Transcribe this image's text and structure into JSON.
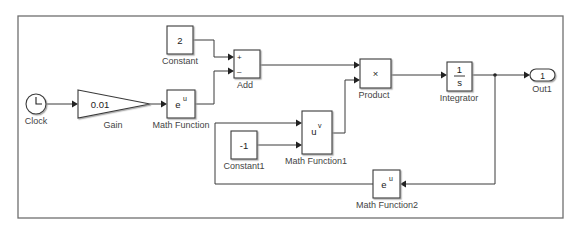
{
  "diagram": {
    "type": "simulink-block-diagram",
    "colors": {
      "background": "#ffffff",
      "frame": "#6f6f6f",
      "block_stroke": "#3a3a3a",
      "label": "#444444"
    },
    "blocks": {
      "clock": {
        "label": "Clock"
      },
      "gain": {
        "label": "Gain",
        "value": "0.01"
      },
      "math_function": {
        "label": "Math Function",
        "base": "e",
        "exponent": "u"
      },
      "constant": {
        "label": "Constant",
        "value": "2"
      },
      "add": {
        "label": "Add",
        "plus": "+",
        "minus": "–"
      },
      "product": {
        "label": "Product",
        "symbol": "×"
      },
      "integrator": {
        "label": "Integrator",
        "numerator": "1",
        "denominator": "s"
      },
      "out1": {
        "label": "Out1",
        "port": "1"
      },
      "math_function1": {
        "label": "Math Function1",
        "base": "u",
        "exponent": "v"
      },
      "constant1": {
        "label": "Constant1",
        "value": "-1"
      },
      "math_function2": {
        "label": "Math Function2",
        "base": "e",
        "exponent": "u"
      }
    },
    "connections": [
      {
        "from": "Clock",
        "to": "Gain"
      },
      {
        "from": "Gain",
        "to": "Math Function"
      },
      {
        "from": "Constant",
        "to": "Add (+)"
      },
      {
        "from": "Math Function",
        "to": "Add (-)"
      },
      {
        "from": "Add",
        "to": "Product (in1)"
      },
      {
        "from": "Math Function1",
        "to": "Product (in2)"
      },
      {
        "from": "Product",
        "to": "Integrator"
      },
      {
        "from": "Integrator",
        "to": "Out1"
      },
      {
        "from": "Integrator",
        "to": "Math Function2"
      },
      {
        "from": "Math Function2",
        "to": "Math Function1 (u)"
      },
      {
        "from": "Constant1",
        "to": "Math Function1 (v)"
      }
    ]
  }
}
